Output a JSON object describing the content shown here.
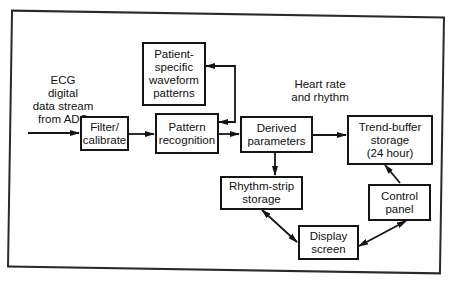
{
  "diagram": {
    "type": "block-flow-diagram",
    "input_label": "ECG digital data stream from ADC",
    "input_lines": [
      "ECG",
      "digital",
      "data stream",
      "from ADC"
    ],
    "annotation_lines": [
      "Heart rate",
      "and rhythm"
    ],
    "nodes": {
      "filter": {
        "lines": [
          "Filter/",
          "calibrate"
        ]
      },
      "pattern": {
        "lines": [
          "Pattern",
          "recognition"
        ]
      },
      "patient": {
        "lines": [
          "Patient-",
          "specific",
          "waveform",
          "patterns"
        ]
      },
      "derived": {
        "lines": [
          "Derived",
          "parameters"
        ]
      },
      "trend": {
        "lines": [
          "Trend-buffer",
          "storage",
          "(24 hour)"
        ]
      },
      "rhythm": {
        "lines": [
          "Rhythm-strip",
          "storage"
        ]
      },
      "control": {
        "lines": [
          "Control",
          "panel"
        ]
      },
      "display": {
        "lines": [
          "Display",
          "screen"
        ]
      }
    },
    "edges": [
      {
        "from": "input",
        "to": "filter",
        "direction": "one-way"
      },
      {
        "from": "filter",
        "to": "pattern",
        "direction": "one-way"
      },
      {
        "from": "pattern",
        "to": "patient",
        "direction": "two-way"
      },
      {
        "from": "pattern",
        "to": "derived",
        "direction": "one-way"
      },
      {
        "from": "derived",
        "to": "trend",
        "direction": "one-way"
      },
      {
        "from": "derived",
        "to": "rhythm",
        "direction": "one-way"
      },
      {
        "from": "rhythm",
        "to": "display",
        "direction": "two-way"
      },
      {
        "from": "display",
        "to": "control",
        "direction": "two-way"
      },
      {
        "from": "control",
        "to": "trend",
        "direction": "one-way"
      }
    ],
    "colors": {
      "line": "#151515",
      "background": "#ffffff"
    }
  }
}
